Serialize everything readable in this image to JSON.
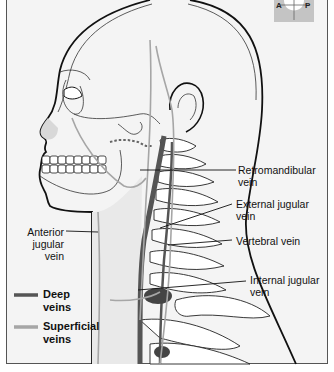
{
  "figure": {
    "orientation_marker": {
      "left": "A",
      "right": "P"
    }
  },
  "labels": {
    "retromandibular": "Retromandibular\nvein",
    "retromandibular_l1": "Retromandibular",
    "retromandibular_l2": "vein",
    "external_jugular_l1": "External jugular",
    "external_jugular_l2": "vein",
    "vertebral": "Vertebral vein",
    "internal_jugular_l1": "Internal jugular",
    "internal_jugular_l2": "vein",
    "anterior_jugular_l1": "Anterior",
    "anterior_jugular_l2": "jugular",
    "anterior_jugular_l3": "vein"
  },
  "legend": {
    "items": [
      {
        "label_l1": "Deep",
        "label_l2": "veins",
        "color": "#555555"
      },
      {
        "label_l1": "Superficial",
        "label_l2": "veins",
        "color": "#a6a6a6"
      }
    ]
  },
  "colors": {
    "background": "#f4f4f4",
    "outline": "#111111",
    "deep_vein": "#555555",
    "superficial_vein": "#a6a6a6"
  }
}
